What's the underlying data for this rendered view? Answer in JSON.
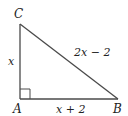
{
  "figure": {
    "type": "right-triangle",
    "right_angle_at": "A",
    "vertices": {
      "A": "A",
      "B": "B",
      "C": "C"
    },
    "sides": {
      "AC": "x",
      "AB": "x + 2",
      "BC": "2x − 2"
    },
    "colors": {
      "stroke": "#4a4a4a",
      "text": "#222222",
      "background": "#ffffff"
    }
  }
}
